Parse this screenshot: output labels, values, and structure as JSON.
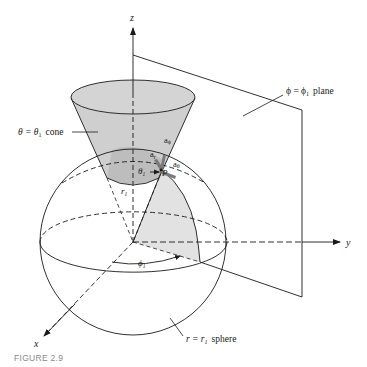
{
  "figure": {
    "caption": "FIGURE 2.9",
    "axes": {
      "z": "z",
      "y": "y",
      "x": "x"
    },
    "surfaces": {
      "cone_label_lhs": "θ = θ",
      "cone_label_sub": "1",
      "cone_label_word": "cone",
      "plane_label_lhs": "ϕ = ϕ",
      "plane_label_sub": "1",
      "plane_label_word": "plane",
      "sphere_label_lhs": "r = r",
      "sphere_label_sub": "1",
      "sphere_label_word": "sphere"
    },
    "annotations": {
      "point": "P",
      "unit_r": "a",
      "unit_r_sub": "r",
      "unit_phi": "a",
      "unit_phi_sub": "ϕ",
      "unit_theta": "a",
      "unit_theta_sub": "θ",
      "theta1": "θ",
      "theta1_sub": "1",
      "r1": "r",
      "r1_sub": "1",
      "phi1": "ϕ",
      "phi1_sub": "1"
    },
    "colors": {
      "line": "#1a1a1a",
      "cone_fill": "#cfcfcf",
      "cone_inner": "#bdbdbd",
      "sector_fill": "#e2e2e2",
      "vector": "#7a7a7a",
      "caption": "#8a8a8a"
    }
  }
}
